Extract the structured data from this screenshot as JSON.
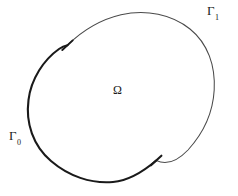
{
  "figure": {
    "type": "mathematical-domain-diagram",
    "background_color": "#ffffff",
    "width": 238,
    "height": 196
  },
  "labels": {
    "interior": {
      "symbol": "Ω",
      "name": "omega",
      "meaning": "interior domain"
    },
    "boundary_outer": {
      "base": "Γ",
      "subscript": "0",
      "name": "gamma-zero",
      "meaning": "lower-left boundary arc"
    },
    "boundary_inner": {
      "base": "Γ",
      "subscript": "1",
      "name": "gamma-one",
      "meaning": "upper-right boundary arc"
    }
  },
  "geometry": {
    "ellipse": {
      "center_x": 121,
      "center_y": 97,
      "radius_x": 96,
      "radius_y": 63,
      "rotation_deg": -28
    },
    "arcs": [
      {
        "name": "gamma-0-arc",
        "stroke": "#1a1a1a",
        "stroke_width": 2.1,
        "weight": "thick"
      },
      {
        "name": "gamma-1-arc",
        "stroke": "#4a4a4a",
        "stroke_width": 1.0,
        "weight": "thin"
      }
    ],
    "tick_marks": [
      {
        "name": "tick-upper-left",
        "x": 67,
        "y": 45,
        "angle_deg": 62
      },
      {
        "name": "tick-lower-right",
        "x": 156,
        "y": 160,
        "angle_deg": 62
      }
    ]
  },
  "colors": {
    "curve_thick": "#1a1a1a",
    "curve_thin": "#4a4a4a",
    "text": "#1a1a1a",
    "background": "#ffffff"
  }
}
